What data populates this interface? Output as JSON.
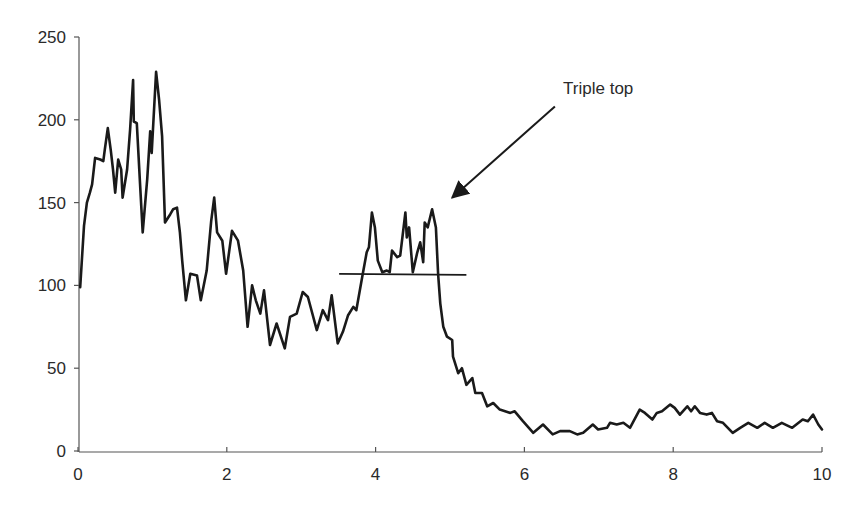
{
  "chart_data": {
    "type": "line",
    "title": "",
    "xlabel": "",
    "ylabel": "",
    "xlim": [
      0,
      10
    ],
    "ylim": [
      0,
      250
    ],
    "grid": false,
    "legend": null,
    "x_ticks": [
      0,
      2,
      4,
      6,
      8,
      10
    ],
    "x_tick_labels": [
      "0",
      "2",
      "4",
      "6",
      "8",
      "10"
    ],
    "y_ticks": [
      0,
      50,
      100,
      150,
      200,
      250
    ],
    "y_tick_labels": [
      "0",
      "50",
      "100",
      "150",
      "200",
      "250"
    ],
    "series": [
      {
        "name": "price",
        "color": "#1a1a1a",
        "x": [
          0.03,
          0.08,
          0.12,
          0.16,
          0.19,
          0.23,
          0.3,
          0.34,
          0.36,
          0.4,
          0.44,
          0.47,
          0.5,
          0.54,
          0.58,
          0.6,
          0.66,
          0.7,
          0.74,
          0.75,
          0.79,
          0.83,
          0.87,
          0.93,
          0.97,
          0.99,
          1.05,
          1.09,
          1.13,
          1.17,
          1.24,
          1.28,
          1.33,
          1.37,
          1.4,
          1.45,
          1.51,
          1.6,
          1.65,
          1.73,
          1.79,
          1.83,
          1.87,
          1.94,
          1.99,
          2.07,
          2.15,
          2.22,
          2.28,
          2.34,
          2.39,
          2.45,
          2.5,
          2.58,
          2.67,
          2.78,
          2.85,
          2.94,
          3.02,
          3.09,
          3.21,
          3.29,
          3.36,
          3.41,
          3.49,
          3.56,
          3.63,
          3.7,
          3.74,
          3.82,
          3.88,
          3.91,
          3.95,
          3.99,
          4.03,
          4.09,
          4.15,
          4.19,
          4.22,
          4.29,
          4.33,
          4.4,
          4.42,
          4.45,
          4.5,
          4.56,
          4.6,
          4.64,
          4.66,
          4.7,
          4.76,
          4.81,
          4.84,
          4.87,
          4.91,
          4.96,
          5.03,
          5.04,
          5.11,
          5.16,
          5.22,
          5.3,
          5.34,
          5.43,
          5.5,
          5.58,
          5.67,
          5.81,
          5.87,
          5.98,
          6.12,
          6.25,
          6.38,
          6.48,
          6.61,
          6.71,
          6.79,
          6.92,
          6.99,
          7.11,
          7.15,
          7.24,
          7.33,
          7.42,
          7.55,
          7.62,
          7.72,
          7.78,
          7.85,
          7.96,
          8.02,
          8.09,
          8.19,
          8.24,
          8.29,
          8.36,
          8.45,
          8.52,
          8.59,
          8.67,
          8.8,
          8.9,
          9.01,
          9.13,
          9.23,
          9.34,
          9.46,
          9.6,
          9.74,
          9.81,
          9.88,
          9.95,
          10.0
        ],
        "y": [
          99,
          136,
          150,
          156,
          161,
          177,
          176,
          175,
          182,
          195,
          182,
          170,
          156,
          176,
          170,
          153,
          170,
          194,
          224,
          199,
          198,
          164,
          132,
          164,
          193,
          180,
          229,
          212,
          190,
          138,
          143,
          146,
          147,
          132,
          115,
          91,
          107,
          106,
          91,
          109,
          139,
          153,
          132,
          127,
          107,
          133,
          127,
          109,
          75,
          100,
          91,
          83,
          97,
          64,
          77,
          62,
          81,
          83,
          96,
          93,
          73,
          85,
          79,
          94,
          65,
          72,
          82,
          87,
          85,
          105,
          120,
          123,
          144,
          135,
          115,
          108,
          109,
          108,
          121,
          117,
          118,
          144,
          129,
          135,
          108,
          120,
          126,
          114,
          138,
          135,
          146,
          135,
          107,
          89,
          75,
          69,
          67,
          57,
          47,
          50,
          40,
          44,
          35,
          35,
          27,
          29,
          25,
          23,
          24,
          18,
          11,
          16,
          10,
          12,
          12,
          10,
          11,
          16,
          13,
          14,
          17,
          16,
          17,
          14,
          25,
          23,
          19,
          23,
          24,
          28,
          26,
          22,
          27,
          24,
          27,
          23,
          22,
          23,
          18,
          17,
          11,
          14,
          17,
          14,
          17,
          14,
          17,
          14,
          19,
          18,
          22,
          16,
          13
        ]
      }
    ],
    "annotations": [
      {
        "type": "hline",
        "name": "support-line",
        "x_start": 3.51,
        "x_end": 5.22,
        "y": 107
      },
      {
        "type": "arrow",
        "name": "triple-top-arrow",
        "from": [
          6.41,
          208
        ],
        "to": [
          5.03,
          153
        ],
        "text": "Triple top",
        "text_pos": [
          6.52,
          219
        ]
      }
    ]
  }
}
